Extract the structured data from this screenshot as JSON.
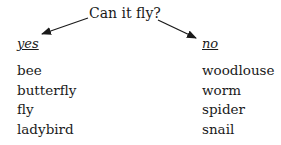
{
  "diagram": {
    "question": "Can it fly?",
    "branches": [
      {
        "label": "yes",
        "items": [
          "bee",
          "butterfly",
          "fly",
          "ladybird"
        ]
      },
      {
        "label": "no",
        "items": [
          "woodlouse",
          "worm",
          "spider",
          "snail"
        ]
      }
    ],
    "colors": {
      "text": "#1a1a1a",
      "background": "#ffffff"
    }
  }
}
